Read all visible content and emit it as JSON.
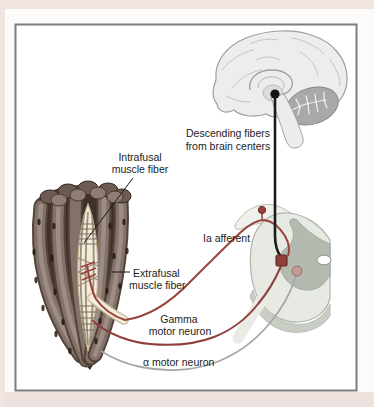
{
  "labels": {
    "descending": {
      "line1": "Descending fibers",
      "line2": "from brain centers"
    },
    "intrafusal": {
      "line1": "Intrafusal",
      "line2": "muscle fiber"
    },
    "extrafusal": {
      "line1": "Extrafusal",
      "line2": "muscle fiber"
    },
    "ia_afferent": "Ia afferent",
    "gamma": {
      "line1": "Gamma",
      "line2": "motor neuron"
    },
    "alpha": "α motor neuron"
  },
  "colors": {
    "afferent_red": "#99413d",
    "motor_red": "#8e3f3c",
    "alpha_gray": "#a6a6a6",
    "descending_black": "#1b1b1b",
    "brain_fill": "#ededed",
    "cerebellum_fill": "#a9a9a9",
    "cord_fill": "#e7eae3",
    "gray_matter": "#b4bab0",
    "spindle_cream": "#f2ecd9",
    "frame_border": "#7d7d7d",
    "page_pink": "#f1e5e1"
  }
}
